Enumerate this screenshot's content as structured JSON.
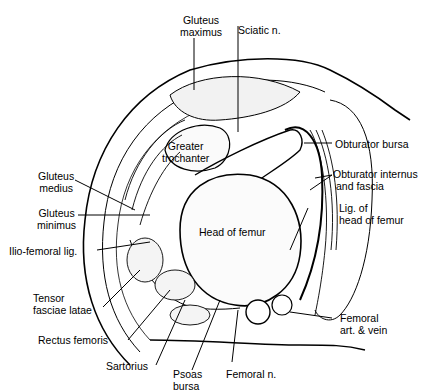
{
  "diagram": {
    "colors": {
      "ink": "#000000",
      "background": "#ffffff",
      "tissue": "#f2f2f2"
    },
    "labels": [
      {
        "id": "gluteus-maximus",
        "line1": "Gluteus",
        "line2": "maximus"
      },
      {
        "id": "sciatic-n",
        "line1": "Sciatic n.",
        "line2": ""
      },
      {
        "id": "obturator-bursa",
        "line1": "Obturator bursa",
        "line2": ""
      },
      {
        "id": "obturator-internus",
        "line1": "Obturator internus",
        "line2": "and fascia"
      },
      {
        "id": "lig-head-femur",
        "line1": "Lig. of",
        "line2": "head of femur"
      },
      {
        "id": "greater-trochanter",
        "line1": "Greater",
        "line2": "trochanter"
      },
      {
        "id": "head-of-femur",
        "line1": "Head of femur",
        "line2": ""
      },
      {
        "id": "gluteus-medius",
        "line1": "Gluteus",
        "line2": "medius"
      },
      {
        "id": "gluteus-minimus",
        "line1": "Gluteus",
        "line2": "minimus"
      },
      {
        "id": "ilio-femoral-lig",
        "line1": "Ilio-femoral lig.",
        "line2": ""
      },
      {
        "id": "tensor-fasciae-latae",
        "line1": "Tensor",
        "line2": "fasciae latae"
      },
      {
        "id": "rectus-femoris",
        "line1": "Rectus femoris",
        "line2": ""
      },
      {
        "id": "sartorius",
        "line1": "Sartorius",
        "line2": ""
      },
      {
        "id": "psoas-bursa",
        "line1": "Psoas",
        "line2": "bursa"
      },
      {
        "id": "femoral-n",
        "line1": "Femoral n.",
        "line2": ""
      },
      {
        "id": "femoral-art-vein",
        "line1": "Femoral",
        "line2": "art. & vein"
      }
    ]
  }
}
